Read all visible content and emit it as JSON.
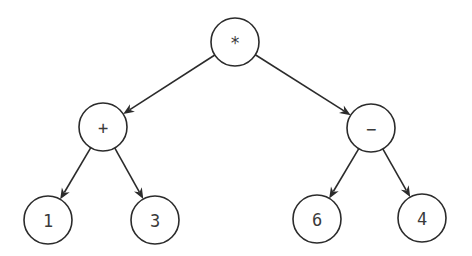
{
  "diagram": {
    "type": "expression-tree",
    "expression": "(1 + 3) * (6 - 4)",
    "nodes": [
      {
        "id": "root",
        "label": "*",
        "role": "operator",
        "cx": 235,
        "cy": 42,
        "r": 24
      },
      {
        "id": "plus",
        "label": "+",
        "role": "operator",
        "cx": 103,
        "cy": 127,
        "r": 24
      },
      {
        "id": "minus",
        "label": "−",
        "role": "operator",
        "cx": 371,
        "cy": 128,
        "r": 24
      },
      {
        "id": "n1",
        "label": "1",
        "role": "operand",
        "cx": 48,
        "cy": 220,
        "r": 24
      },
      {
        "id": "n3",
        "label": "3",
        "role": "operand",
        "cx": 155,
        "cy": 220,
        "r": 24
      },
      {
        "id": "n6",
        "label": "6",
        "role": "operand",
        "cx": 317,
        "cy": 219,
        "r": 24
      },
      {
        "id": "n4",
        "label": "4",
        "role": "operand",
        "cx": 422,
        "cy": 218,
        "r": 24
      }
    ],
    "edges": [
      {
        "from": "root",
        "to": "plus"
      },
      {
        "from": "root",
        "to": "minus"
      },
      {
        "from": "plus",
        "to": "n1"
      },
      {
        "from": "plus",
        "to": "n3"
      },
      {
        "from": "minus",
        "to": "n6"
      },
      {
        "from": "minus",
        "to": "n4"
      }
    ],
    "colors": {
      "stroke": "#2b2b2b",
      "label": "#3a3a3a",
      "background": "#ffffff"
    }
  }
}
